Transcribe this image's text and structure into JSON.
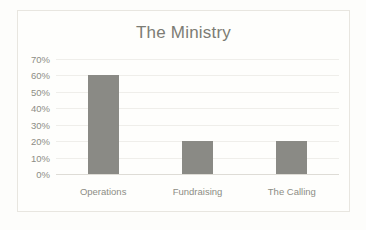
{
  "chart_data": {
    "type": "bar",
    "title": "The Ministry",
    "xlabel": "",
    "ylabel": "",
    "categories": [
      "Operations",
      "Fundraising",
      "The Calling"
    ],
    "values": [
      60,
      20,
      20
    ],
    "value_suffix": "%",
    "ylim": [
      0,
      70
    ],
    "ytick_values": [
      0,
      10,
      20,
      30,
      40,
      50,
      60,
      70
    ],
    "ytick_labels": [
      "0%",
      "10%",
      "20%",
      "30%",
      "40%",
      "50%",
      "60%",
      "70%"
    ],
    "grid": true,
    "legend": false,
    "series": [
      {
        "name": "The Ministry",
        "values": [
          60,
          20,
          20
        ]
      }
    ],
    "colors": {
      "bar": "#8a8a85",
      "gridline": "#efeeea",
      "baseline": "#dedcd6",
      "title_text": "#7c7c74",
      "tick_text": "#8d8d85",
      "plot_background": "#fefefc",
      "frame_border": "#e8e6e0",
      "page_background": "#fdfdfb"
    }
  }
}
